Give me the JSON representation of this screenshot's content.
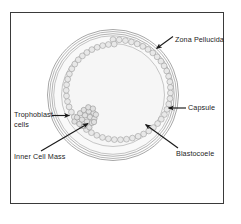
{
  "figure": {
    "frame": {
      "border_color": "#3a3a3a"
    },
    "colors": {
      "outline": "#8a8a8a",
      "cell_outline": "#9a9a9a",
      "cavity_fill": "#f6f6f6",
      "cell_fill": "#e4e4e4",
      "arrow": "#1a1a1a",
      "text": "#1c1c1c",
      "page_background": "#ffffff"
    },
    "structures": [
      {
        "name": "zona-pellucida",
        "description": "outermost thin membrane ring"
      },
      {
        "name": "capsule",
        "description": "layer just inside the zona pellucida"
      },
      {
        "name": "trophoblast-cell-ring",
        "description": "ring of small cells lining the inner wall"
      },
      {
        "name": "blastocoele",
        "description": "fluid-filled central cavity"
      },
      {
        "name": "inner-cell-mass",
        "description": "cluster of cells at the lower-left inner wall"
      }
    ],
    "labels": {
      "zona_pellucida": "Zona Pellucida",
      "capsule": "Capsule",
      "blastocoele": "Blastocoele",
      "trophoblast_line1": "Trophoblast",
      "trophoblast_line2": "cells",
      "inner_cell_mass": "Inner Cell Mass"
    }
  }
}
